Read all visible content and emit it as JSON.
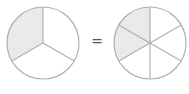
{
  "diagram": {
    "left_circle": {
      "parts": 3,
      "shaded": 1,
      "fraction": "1/3"
    },
    "right_circle": {
      "parts": 6,
      "shaded": 2,
      "fraction": "2/6"
    },
    "operator": "=",
    "colors": {
      "stroke": "#b0b0b0",
      "shade": "#ececec",
      "fill": "#ffffff"
    }
  }
}
